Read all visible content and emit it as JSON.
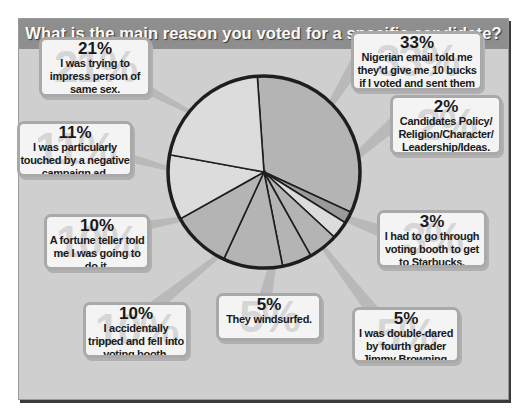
{
  "title": "What is the main reason you voted for a specific candidate?",
  "colors": {
    "board": "#cfcfcf",
    "title_bar": "#8e8e8e",
    "callout_bg": "#f4f4f4",
    "slice_light": "#dcdcdc",
    "slice_dark": "#b4b4b4"
  },
  "callouts": [
    {
      "pct": "21%",
      "text": "I was trying to impress person of same sex."
    },
    {
      "pct": "33%",
      "text": "Nigerian email told me they'd give me 10 bucks if I voted and sent them an iPod."
    },
    {
      "pct": "11%",
      "text": "I was particularly touched by a negative campaign ad."
    },
    {
      "pct": "2%",
      "text": "Candidates Policy/ Religion/Character/ Leadership/Ideas."
    },
    {
      "pct": "10%",
      "text": "A fortune teller told me I was going to do it."
    },
    {
      "pct": "3%",
      "text": "I had to go through voting booth to get to Starbucks."
    },
    {
      "pct": "10%",
      "text": "I accidentally tripped and fell into voting booth."
    },
    {
      "pct": "5%",
      "text": "They windsurfed."
    },
    {
      "pct": "5%",
      "text": "I was double-dared by fourth grader Jimmy Browning."
    }
  ],
  "chart_data": {
    "type": "pie",
    "title": "What is the main reason you voted for a specific candidate?",
    "categories": [
      "Nigerian email told me they'd give me 10 bucks if I voted and sent them an iPod.",
      "Candidates Policy/Religion/Character/Leadership/Ideas.",
      "I had to go through voting booth to get to Starbucks.",
      "I was double-dared by fourth grader Jimmy Browning.",
      "They windsurfed.",
      "I accidentally tripped and fell into voting booth.",
      "A fortune teller told me I was going to do it.",
      "I was particularly touched by a negative campaign ad.",
      "I was trying to impress person of same sex."
    ],
    "values": [
      33,
      2,
      3,
      5,
      5,
      10,
      10,
      11,
      21
    ],
    "unit": "%",
    "start_angle_deg": -4,
    "direction": "clockwise",
    "legend": "callout labels"
  }
}
